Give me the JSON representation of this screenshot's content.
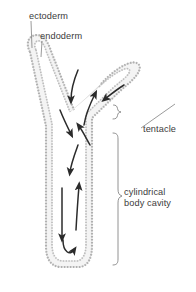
{
  "figure": {
    "kind": "biology-diagram",
    "background_color": "#ffffff"
  },
  "labels": {
    "ectoderm": "ectoderm",
    "endoderm": "endoderm",
    "tentacle": "tentacle",
    "body_cavity_line1": "cylindrical",
    "body_cavity_line2": "body cavity"
  },
  "colors": {
    "text": "#3b3b3b",
    "leader_line": "#6f6f6f",
    "bracket": "#6f6f6f",
    "arrow": "#2b2b2b",
    "wall_fill": "#f2f2f2",
    "wall_band": "#e2e2e2",
    "cell_layer": "#b4b4b4",
    "outline": "#cfcfcf"
  },
  "structures": [
    {
      "name": "left-tentacle",
      "description": "hollow tentacle angled up and to the left"
    },
    {
      "name": "right-tentacle",
      "description": "hollow tentacle angled up and to the right"
    },
    {
      "name": "cylindrical-body-cavity",
      "description": "central sac-like cavity closed at the base"
    },
    {
      "name": "ectoderm",
      "description": "outer stippled cell layer"
    },
    {
      "name": "endoderm",
      "description": "inner stippled cell layer lining the cavity"
    }
  ],
  "flow_arrows": [
    {
      "name": "inflow-left-tentacle",
      "direction": "down-into-cavity"
    },
    {
      "name": "inflow-right-tentacle",
      "direction": "down-left-into-cavity"
    },
    {
      "name": "inflow-center",
      "direction": "down"
    },
    {
      "name": "outflow-center",
      "direction": "up"
    },
    {
      "name": "downflow-body",
      "direction": "down"
    },
    {
      "name": "upflow-body",
      "direction": "up"
    },
    {
      "name": "down-long-body",
      "direction": "down"
    },
    {
      "name": "base-return",
      "direction": "u-turn-up"
    }
  ]
}
